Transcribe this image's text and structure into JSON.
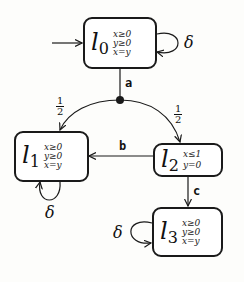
{
  "locations": [
    {
      "id": "l0",
      "name": "l",
      "index": "0",
      "invariant": [
        "x≥0",
        "y≥0",
        "x=y"
      ]
    },
    {
      "id": "l1",
      "name": "l",
      "index": "1",
      "invariant": [
        "x≥0",
        "y≥0",
        "x=y"
      ]
    },
    {
      "id": "l2",
      "name": "l",
      "index": "2",
      "invariant": [
        "x≤1",
        "y=0"
      ]
    },
    {
      "id": "l3",
      "name": "l",
      "index": "3",
      "invariant": [
        "x≥0",
        "y≥0",
        "x=y"
      ]
    }
  ],
  "edges": {
    "a": "a",
    "b": "b",
    "c": "c",
    "prob_left": {
      "num": "1",
      "den": "2"
    },
    "prob_right": {
      "num": "1",
      "den": "2"
    },
    "delta": "δ"
  },
  "colors": {
    "stroke": "#1a1a1a",
    "background": "#fdfdfb"
  }
}
